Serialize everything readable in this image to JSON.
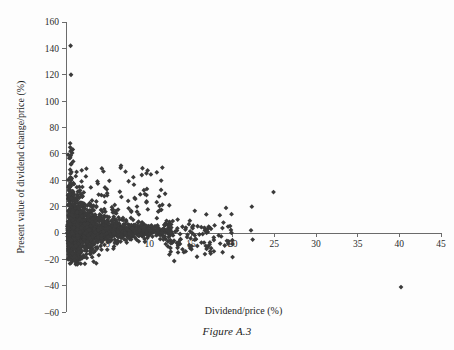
{
  "figure": {
    "caption": "Figure A.3"
  },
  "chart_data": {
    "type": "scatter",
    "title": "",
    "xlabel": "Dividend/price (%)",
    "ylabel": "Present value of dividend change/price (%)",
    "xlim": [
      0,
      45
    ],
    "ylim": [
      -60,
      160
    ],
    "xticks": [
      5,
      10,
      15,
      20,
      25,
      30,
      35,
      40,
      45
    ],
    "yticks": [
      -60,
      -40,
      -20,
      0,
      20,
      40,
      60,
      80,
      100,
      120,
      140,
      160
    ],
    "xtick_labels": [
      "5",
      "10",
      "15",
      "20",
      "25",
      "30",
      "35",
      "40",
      "45"
    ],
    "ytick_labels": [
      "-60",
      "-40",
      "-20",
      "0",
      "20",
      "40",
      "60",
      "80",
      "100",
      "120",
      "140",
      "160"
    ],
    "grid": false,
    "legend": null,
    "marker": "diamond",
    "marker_color": "#3a3a3a",
    "marker_size": 2.4,
    "n_points": 1180,
    "notable_points": [
      {
        "x": 0.55,
        "y": 142
      },
      {
        "x": 0.6,
        "y": 120
      },
      {
        "x": 0.5,
        "y": 68
      },
      {
        "x": 0.5,
        "y": 65
      },
      {
        "x": 0.55,
        "y": 62
      },
      {
        "x": 0.5,
        "y": 57
      },
      {
        "x": 0.6,
        "y": 52
      },
      {
        "x": 0.5,
        "y": 48
      },
      {
        "x": 0.55,
        "y": 45
      },
      {
        "x": 0.5,
        "y": 42
      },
      {
        "x": 0.6,
        "y": 40
      },
      {
        "x": 0.5,
        "y": 38
      },
      {
        "x": 4.3,
        "y": 49
      },
      {
        "x": 6.6,
        "y": 51
      },
      {
        "x": 9.1,
        "y": 44
      },
      {
        "x": 10.9,
        "y": 46
      },
      {
        "x": 24.9,
        "y": 31
      },
      {
        "x": 22.3,
        "y": 20
      },
      {
        "x": 19.2,
        "y": 19
      },
      {
        "x": 40.2,
        "y": -41
      },
      {
        "x": 22.2,
        "y": 2
      },
      {
        "x": 22.4,
        "y": -5
      },
      {
        "x": 18.5,
        "y": -8
      },
      {
        "x": 17.3,
        "y": -14
      }
    ],
    "series": [
      {
        "name": "observations",
        "points_summary": "cluster",
        "cluster": {
          "x_mode": 2.5,
          "x_spread": 3.2,
          "y_center": 2.0,
          "y_spread_near_axis": 14,
          "y_spread_far": 5
        }
      }
    ]
  },
  "geometry": {
    "plot_left": 66,
    "plot_right": 441,
    "y_zero_px": 233,
    "y_top_px": 22,
    "px_per_x_unit": 8.333,
    "px_per_y_unit": 1.4
  }
}
